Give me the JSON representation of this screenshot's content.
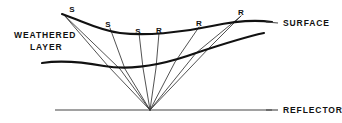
{
  "figure": {
    "width": 342,
    "height": 123,
    "background_color": "#ffffff",
    "line_color": "#111111",
    "ray_color": "#333333",
    "reflector_color": "#444444"
  },
  "labels": {
    "weathered_line1": "WEATHERED",
    "weathered_line2": "LAYER",
    "surface": "SURFACE",
    "reflector": "REFLECTOR"
  },
  "stations": [
    {
      "id": "s1",
      "label": "S",
      "x": 72,
      "y": 10,
      "type": "source"
    },
    {
      "id": "s2",
      "label": "S",
      "x": 108,
      "y": 25,
      "type": "source"
    },
    {
      "id": "s3",
      "label": "S",
      "x": 138,
      "y": 32,
      "type": "source"
    },
    {
      "id": "r1",
      "label": "R",
      "x": 159,
      "y": 31,
      "type": "receiver"
    },
    {
      "id": "r2",
      "label": "R",
      "x": 199,
      "y": 24,
      "type": "receiver"
    },
    {
      "id": "r3",
      "label": "R",
      "x": 241,
      "y": 13,
      "type": "receiver"
    }
  ],
  "geometry": {
    "surface_path": "M 62,14 C 85,22 98,30 120,33 C 145,36 180,33 212,26 C 240,20 258,20 272,22",
    "base_path": "M 42,63 C 62,60 82,62 104,66 C 128,70 160,66 196,53 C 226,43 250,36 264,33",
    "reflector_path": "M 55,110 L 272,110",
    "convergence": {
      "x": 150,
      "y": 110
    },
    "raypaths": [
      "M 64,15 L 108,66 L 150,110",
      "M 64,15 L 120,69 L 150,110",
      "M 110,28 L 125,69 L 150,110",
      "M 139,33 L 143,68 L 150,110",
      "M 159,33 L 156,68 L 150,110",
      "M 199,27 L 175,62 L 150,110",
      "M 241,16 L 196,53 L 150,110",
      "M 241,16 L 210,47 L 150,110"
    ]
  },
  "callout_ticks": {
    "surface_tick": "M 266,22 L 278,23",
    "reflector_tick": "M 266,110 L 278,110"
  }
}
